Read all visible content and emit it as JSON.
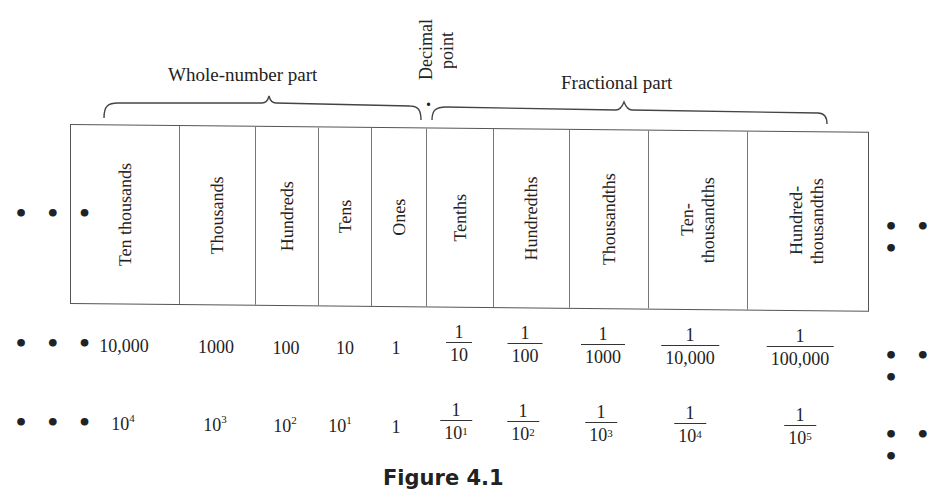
{
  "figure": {
    "caption": "Figure 4.1",
    "ellipsis": "• • •"
  },
  "braces": {
    "whole": {
      "label": "Whole-number part"
    },
    "decimal": {
      "label_line1": "Decimal",
      "label_line2": "point",
      "marker": "."
    },
    "fractional": {
      "label": "Fractional part"
    }
  },
  "columns": [
    {
      "name": "Ten thousands",
      "line1": "Ten thousands",
      "line2": "",
      "value": "10,000",
      "power": {
        "type": "pow",
        "base": "10",
        "exp": "4"
      }
    },
    {
      "name": "Thousands",
      "line1": "Thousands",
      "line2": "",
      "value": "1000",
      "power": {
        "type": "pow",
        "base": "10",
        "exp": "3"
      }
    },
    {
      "name": "Hundreds",
      "line1": "Hundreds",
      "line2": "",
      "value": "100",
      "power": {
        "type": "pow",
        "base": "10",
        "exp": "2"
      }
    },
    {
      "name": "Tens",
      "line1": "Tens",
      "line2": "",
      "value": "10",
      "power": {
        "type": "pow",
        "base": "10",
        "exp": "1"
      }
    },
    {
      "name": "Ones",
      "line1": "Ones",
      "line2": "",
      "value": "1",
      "power": {
        "type": "plain",
        "text": "1"
      }
    },
    {
      "name": "Tenths",
      "line1": "Tenths",
      "line2": "",
      "value_num": "1",
      "value_den": "10",
      "power_num": "1",
      "power_base": "10",
      "power_exp": "1"
    },
    {
      "name": "Hundredths",
      "line1": "Hundredths",
      "line2": "",
      "value_num": "1",
      "value_den": "100",
      "power_num": "1",
      "power_base": "10",
      "power_exp": "2"
    },
    {
      "name": "Thousandths",
      "line1": "Thousandths",
      "line2": "",
      "value_num": "1",
      "value_den": "1000",
      "power_num": "1",
      "power_base": "10",
      "power_exp": "3"
    },
    {
      "name": "Ten-thousandths",
      "line1": "Ten-",
      "line2": "thousandths",
      "value_num": "1",
      "value_den": "10,000",
      "power_num": "1",
      "power_base": "10",
      "power_exp": "4"
    },
    {
      "name": "Hundred-thousandths",
      "line1": "Hundred-",
      "line2": "thousandths",
      "value_num": "1",
      "value_den": "100,000",
      "power_num": "1",
      "power_base": "10",
      "power_exp": "5"
    }
  ]
}
